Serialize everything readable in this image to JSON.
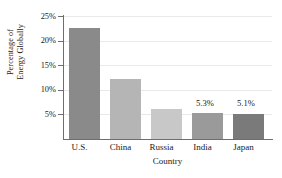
{
  "chart_data": {
    "type": "bar",
    "title": "",
    "xlabel": "Country",
    "ylabel_lines": [
      "Percentage of",
      "Energy Globally"
    ],
    "ylabel": "Percentage of Energy Globally",
    "categories": [
      "U.S.",
      "China",
      "Russia",
      "India",
      "Japan"
    ],
    "values": [
      22.5,
      12.1,
      6.1,
      5.3,
      5.1
    ],
    "value_labels": [
      "",
      "",
      "",
      "5.3%",
      "5.1%"
    ],
    "bar_colors": [
      "#8a8a8a",
      "#b5b5b5",
      "#c8c8c8",
      "#9a9a9a",
      "#7a7a7a"
    ],
    "ylim": [
      0,
      25
    ],
    "yticks": [
      5,
      10,
      15,
      20,
      25
    ],
    "ytick_labels": [
      "5%",
      "10%",
      "15%",
      "20%",
      "25%"
    ],
    "grid": true,
    "grid_color": "#e9e9e9",
    "axis_color": "#6e6e6e",
    "legend": "none",
    "background": "#ffffff"
  }
}
